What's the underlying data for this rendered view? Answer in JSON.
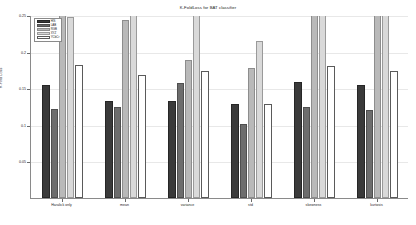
{
  "chart_data": {
    "type": "bar",
    "title": "K-FoldLoss for BAT classifier",
    "xlabel": "",
    "ylabel": "K-Fold Loss",
    "ylim": [
      0,
      0.25
    ],
    "grid": false,
    "legend_position": "upper-left",
    "categories": [
      "Haralick only",
      "mean",
      "variance",
      "std",
      "skewness",
      "kurtosis"
    ],
    "ytick_labels": [
      "0.05",
      "0.1",
      "0.15",
      "0.2",
      "0.25"
    ],
    "ytick_values": [
      0.05,
      0.1,
      0.15,
      0.2,
      0.25
    ],
    "series": [
      {
        "name": "HIS",
        "values": [
          0.155,
          0.132,
          0.133,
          0.128,
          0.159,
          0.155
        ]
      },
      {
        "name": "LAB",
        "values": [
          0.122,
          0.124,
          0.157,
          0.101,
          0.124,
          0.12
        ]
      },
      {
        "name": "RGB",
        "values": [
          0.252,
          0.243,
          0.188,
          0.178,
          0.254,
          0.25
        ]
      },
      {
        "name": "XYZ",
        "values": [
          0.247,
          0.251,
          0.255,
          0.214,
          0.258,
          0.253
        ]
      },
      {
        "name": "YCbCr",
        "values": [
          0.182,
          0.168,
          0.174,
          0.129,
          0.18,
          0.173
        ]
      }
    ]
  },
  "legend": {
    "entries": [
      {
        "label": "HIS"
      },
      {
        "label": "LAB"
      },
      {
        "label": "RGB"
      },
      {
        "label": "XYZ"
      },
      {
        "label": "YCbCr"
      }
    ]
  },
  "colors": {
    "series0": "#3a3a3a",
    "series1": "#6d6d6d",
    "series2": "#b9b9b9",
    "series3": "#d9d9d9",
    "series4": "#ffffff",
    "axis": "#8a8a8a",
    "text": "#1a1a1a"
  }
}
